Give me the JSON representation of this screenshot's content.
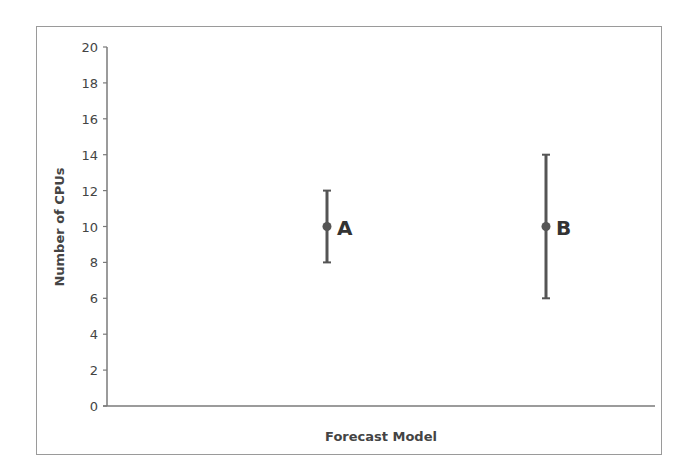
{
  "chart_data": {
    "type": "scatter",
    "title": "",
    "xlabel": "Forecast Model",
    "ylabel": "Number of CPUs",
    "ylim": [
      0,
      20
    ],
    "yticks": [
      0,
      2,
      4,
      6,
      8,
      10,
      12,
      14,
      16,
      18,
      20
    ],
    "grid": false,
    "legend": null,
    "series": [
      {
        "name": "Forecast",
        "points": [
          {
            "label": "A",
            "x": 1,
            "y": 10,
            "error_low": 8,
            "error_high": 12
          },
          {
            "label": "B",
            "x": 2,
            "y": 10,
            "error_low": 6,
            "error_high": 14
          }
        ]
      }
    ],
    "colors": {
      "marker": "#555555",
      "axis": "#7a7a7a",
      "text": "#444444",
      "frame": "#9a9a9a"
    }
  }
}
